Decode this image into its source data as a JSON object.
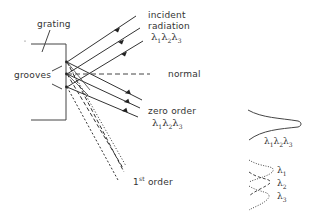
{
  "diagram": {
    "labels": {
      "grating": "grating",
      "grooves": "grooves",
      "incident_line1": "incident",
      "incident_line2": "radiation",
      "normal": "normal",
      "zero_order": "zero order",
      "first_order_num": "1",
      "first_order_sup": "st",
      "first_order_word": " order"
    },
    "wavelengths": {
      "l1": "λ",
      "l1_sub": "1",
      "l2": "λ",
      "l2_sub": "2",
      "l3": "λ",
      "l3_sub": "3"
    },
    "inset": {
      "combined_label": "λ1λ2λ3",
      "separated": [
        {
          "sym": "λ",
          "sub": "1",
          "style": "dotted"
        },
        {
          "sym": "λ",
          "sub": "2",
          "style": "dashed"
        },
        {
          "sym": "λ",
          "sub": "3",
          "style": "dotted"
        }
      ]
    },
    "colors": {
      "line": "#333333",
      "background": "#ffffff"
    }
  }
}
